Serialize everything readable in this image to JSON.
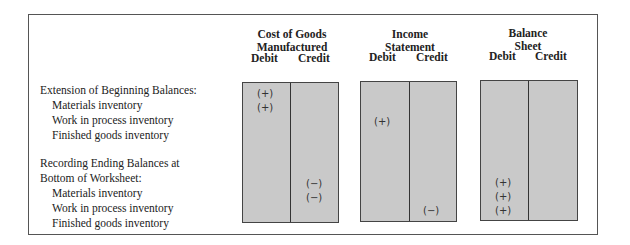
{
  "row_labels": {
    "section_beginning": "Extension of Beginning Balances:",
    "beg_materials": "Materials inventory",
    "beg_wip": "Work in process inventory",
    "beg_finished": "Finished goods inventory",
    "section_ending_line1": "Recording Ending Balances at",
    "section_ending_line2": "Bottom of Worksheet:",
    "end_materials": "Materials inventory",
    "end_wip": "Work in process inventory",
    "end_finished": "Finished goods inventory"
  },
  "columns": [
    {
      "title_line1": "Cost of Goods",
      "title_line2": "Manufactured",
      "debit": "Debit",
      "credit": "Credit",
      "marks": {
        "beg_materials_debit": "(+)",
        "beg_wip_debit": "(+)",
        "end_materials_credit": "(−)",
        "end_wip_credit": "(−)"
      }
    },
    {
      "title_line1": "Income",
      "title_line2": "Statement",
      "debit": "Debit",
      "credit": "Credit",
      "marks": {
        "beg_finished_debit": "(+)",
        "end_finished_credit": "(−)"
      }
    },
    {
      "title_line1": "Balance",
      "title_line2": "Sheet",
      "debit": "Debit",
      "credit": "Credit",
      "marks": {
        "end_materials_debit": "(+)",
        "end_wip_debit": "(+)",
        "end_finished_debit": "(+)"
      }
    }
  ]
}
